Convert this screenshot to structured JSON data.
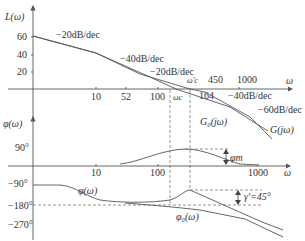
{
  "magnitude_plot": {
    "y_axis_label": "L(ω)",
    "y_ticks": [
      "60",
      "40",
      "20"
    ],
    "x_axis_label": "ω",
    "x_ticks_below": [
      "10",
      "52",
      "100",
      "164"
    ],
    "x_ticks_above": [
      "450",
      "1000"
    ],
    "omega_c_label": "ωc",
    "omega_c_prime_label": "ω'c",
    "slopes": {
      "s1": "−20dB/dec",
      "s2": "−40dB/dec",
      "s3": "−20dB/dec",
      "s4": "−40dB/dec",
      "s5": "−60dB/dec"
    },
    "curve_labels": {
      "g0": "G₀(jω)",
      "g": "G(jω)"
    }
  },
  "phase_plot": {
    "y_axis_label": "φ(ω)",
    "y_ticks": [
      "90°",
      "−90°",
      "−180°",
      "−270°"
    ],
    "x_axis_label": "ω",
    "x_ticks": [
      "10",
      "100",
      "1000"
    ],
    "phi_m_label": "φm",
    "gamma_label": "γ'=45°",
    "curve_labels": {
      "phi": "φ(ω)",
      "phi0": "φ₀(ω)"
    }
  }
}
